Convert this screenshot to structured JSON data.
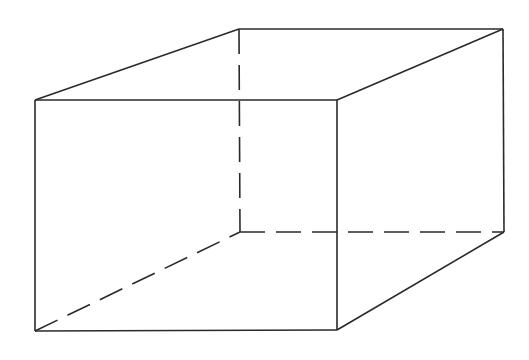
{
  "diagram": {
    "type": "wireframe-rectangular-prism",
    "background": "#ffffff",
    "stroke_color": "#2a2a2a",
    "stroke_width": 1.6,
    "dash_pattern": "25 11",
    "vertices": {
      "front_top_left": [
        35,
        100
      ],
      "front_top_right": [
        337,
        100
      ],
      "front_bottom_left": [
        35,
        331
      ],
      "front_bottom_right": [
        337,
        330
      ],
      "back_top_left": [
        239,
        29
      ],
      "back_top_right": [
        503,
        29
      ],
      "back_bottom_left": [
        240,
        232
      ],
      "back_bottom_right": [
        504,
        232
      ]
    },
    "visible_edges": [
      {
        "name": "front-top-edge",
        "from": "front_top_left",
        "to": "front_top_right"
      },
      {
        "name": "front-bottom-edge",
        "from": "front_bottom_left",
        "to": "front_bottom_right"
      },
      {
        "name": "front-left-edge",
        "from": "front_top_left",
        "to": "front_bottom_left"
      },
      {
        "name": "front-right-edge",
        "from": "front_top_right",
        "to": "front_bottom_right"
      },
      {
        "name": "back-top-edge",
        "from": "back_top_left",
        "to": "back_top_right"
      },
      {
        "name": "back-right-edge",
        "from": "back_top_right",
        "to": "back_bottom_right"
      },
      {
        "name": "top-left-receding-edge",
        "from": "front_top_left",
        "to": "back_top_left"
      },
      {
        "name": "top-right-receding-edge",
        "from": "front_top_right",
        "to": "back_top_right"
      },
      {
        "name": "bottom-right-receding-edge",
        "from": "front_bottom_right",
        "to": "back_bottom_right"
      }
    ],
    "hidden_edges": [
      {
        "name": "back-left-hidden-edge",
        "from": "back_top_left",
        "to": "back_bottom_left"
      },
      {
        "name": "back-bottom-hidden-edge",
        "from": "back_bottom_left",
        "to": "back_bottom_right"
      },
      {
        "name": "bottom-left-hidden-receding-edge",
        "from": "front_bottom_left",
        "to": "back_bottom_left"
      }
    ]
  }
}
